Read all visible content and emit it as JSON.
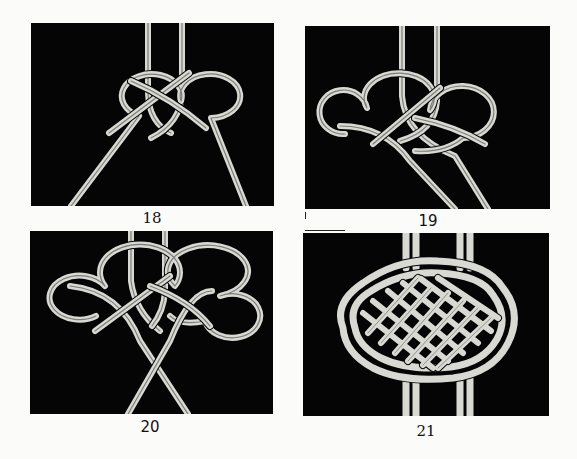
{
  "page": {
    "background": "#fbfbfa",
    "panel_background": "#050505",
    "cord_color": "#d9d9d4"
  },
  "figures": [
    {
      "step": "18",
      "description": "Cord loops crossed into two interlocking rings below two vertical strands"
    },
    {
      "step": "19",
      "description": "Additional loop added on the left side of the knot"
    },
    {
      "step": "20",
      "description": "Symmetrical loops on both sides with working ends crossing below"
    },
    {
      "step": "21",
      "description": "Finished woven knot with grid-like interlaced body"
    }
  ]
}
